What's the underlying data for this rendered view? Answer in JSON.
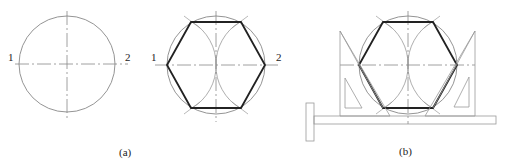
{
  "figure": {
    "panels": [
      {
        "id": "a",
        "caption": "(a)",
        "description": "circle with centerlines",
        "labels": [
          "1",
          "2"
        ]
      },
      {
        "id": "a2",
        "caption": "",
        "description": "inscribed regular hexagon constructed with arcs",
        "labels": [
          "1",
          "2"
        ]
      },
      {
        "id": "b",
        "caption": "(b)",
        "description": "hexagon drawn with T-square and 30-60 set squares"
      }
    ],
    "colors": {
      "thin_line": "#888888",
      "thick_line": "#222222",
      "text": "#222222"
    }
  }
}
